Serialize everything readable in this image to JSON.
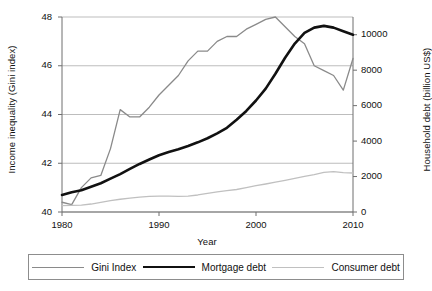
{
  "chart_data": {
    "type": "line",
    "title": "",
    "xlabel": "Year",
    "ylabel": "Income inequality (Gini index)",
    "ylabel_right": "Household debt (billion US$)",
    "xlim": [
      1980,
      2010
    ],
    "ylim": [
      40,
      48
    ],
    "ylim_right": [
      0,
      11000
    ],
    "xticks": [
      1980,
      1990,
      2000,
      2010
    ],
    "yticks": [
      40,
      42,
      44,
      46,
      48
    ],
    "yticks_right": [
      0,
      2000,
      4000,
      6000,
      8000,
      10000
    ],
    "grid": "horizontal",
    "legend_position": "bottom",
    "x": [
      1980,
      1981,
      1982,
      1983,
      1984,
      1985,
      1986,
      1987,
      1988,
      1989,
      1990,
      1991,
      1992,
      1993,
      1994,
      1995,
      1996,
      1997,
      1998,
      1999,
      2000,
      2001,
      2002,
      2003,
      2004,
      2005,
      2006,
      2007,
      2008,
      2009,
      2010
    ],
    "series": [
      {
        "name": "Gini Index",
        "axis": "left",
        "unit": "Gini index",
        "color": "#8a8a8a",
        "width": 1.3,
        "values": [
          40.4,
          40.3,
          41.0,
          41.4,
          41.5,
          42.6,
          44.2,
          43.9,
          43.9,
          44.3,
          44.8,
          45.2,
          45.6,
          46.2,
          46.6,
          46.6,
          47.0,
          47.2,
          47.2,
          47.5,
          47.7,
          47.9,
          48.0,
          47.6,
          47.2,
          46.9,
          46.0,
          45.8,
          45.6,
          45.0,
          46.3
        ]
      },
      {
        "name": "Mortgage debt",
        "axis": "right",
        "unit": "billion US$",
        "color": "#111111",
        "width": 2.6,
        "values": [
          960,
          1120,
          1230,
          1420,
          1620,
          1880,
          2140,
          2430,
          2710,
          2960,
          3200,
          3380,
          3540,
          3720,
          3930,
          4160,
          4440,
          4750,
          5200,
          5700,
          6290,
          6960,
          7800,
          8700,
          9500,
          10100,
          10400,
          10500,
          10400,
          10200,
          10000
        ]
      },
      {
        "name": "Consumer debt",
        "axis": "right",
        "unit": "billion US$",
        "color": "#c0c0c0",
        "width": 1.3,
        "values": [
          360,
          370,
          390,
          450,
          540,
          640,
          720,
          780,
          840,
          880,
          900,
          890,
          880,
          900,
          960,
          1050,
          1130,
          1200,
          1270,
          1380,
          1490,
          1580,
          1680,
          1790,
          1900,
          2010,
          2110,
          2230,
          2280,
          2220,
          2200
        ]
      }
    ],
    "annotations": []
  },
  "axes": {
    "left_title": "Income inequality (Gini index)",
    "right_title": "Household debt (billion US$)",
    "x_title": "Year",
    "left_ticks": [
      "40",
      "42",
      "44",
      "46",
      "48"
    ],
    "right_ticks": [
      "0",
      "2000",
      "4000",
      "6000",
      "8000",
      "10000"
    ],
    "x_ticks": [
      "1980",
      "1990",
      "2000",
      "2010"
    ]
  },
  "legend": {
    "items": [
      {
        "label": "Gini Index",
        "swatch": "gini-line-swatch"
      },
      {
        "label": "Mortgage debt",
        "swatch": "mortgage-line-swatch"
      },
      {
        "label": "Consumer debt",
        "swatch": "consumer-line-swatch"
      }
    ]
  },
  "colors": {
    "gini": "#8a8a8a",
    "mortgage": "#111111",
    "consumer": "#c0c0c0",
    "grid": "#b5b5b5",
    "axis": "#6f6f6f",
    "background": "#ffffff"
  }
}
